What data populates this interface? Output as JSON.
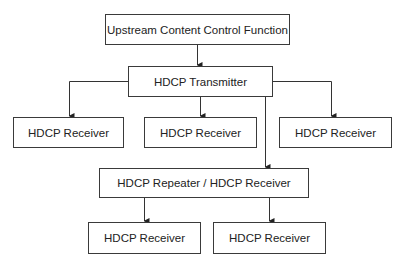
{
  "diagram": {
    "type": "hierarchy",
    "nodes": {
      "upstream": "Upstream Content Control Function",
      "transmitter": "HDCP Transmitter",
      "receiver_1": "HDCP Receiver",
      "receiver_2": "HDCP Receiver",
      "receiver_3": "HDCP Receiver",
      "repeater": "HDCP Repeater / HDCP Receiver",
      "receiver_4": "HDCP Receiver",
      "receiver_5": "HDCP Receiver"
    },
    "edges": [
      [
        "upstream",
        "transmitter"
      ],
      [
        "transmitter",
        "receiver_1"
      ],
      [
        "transmitter",
        "receiver_2"
      ],
      [
        "transmitter",
        "receiver_3"
      ],
      [
        "transmitter",
        "repeater"
      ],
      [
        "repeater",
        "receiver_4"
      ],
      [
        "repeater",
        "receiver_5"
      ]
    ]
  }
}
